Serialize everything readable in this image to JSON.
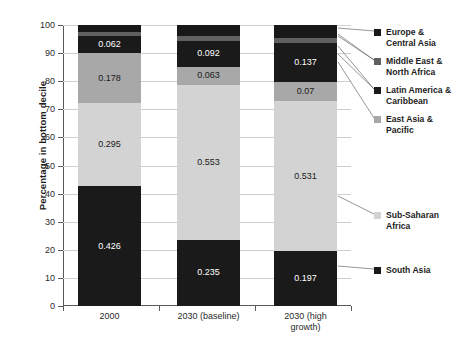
{
  "chart_data": {
    "type": "bar",
    "subtype": "stacked-bar-100-percent",
    "title": "",
    "xlabel": "",
    "ylabel": "Percentage in bottom decile",
    "ylim": [
      0,
      100
    ],
    "yticks": [
      0,
      10,
      20,
      30,
      40,
      50,
      60,
      70,
      80,
      90,
      100
    ],
    "grid": true,
    "legend_position": "right",
    "categories": [
      "2000",
      "2030 (baseline)",
      "2030 (high growth)"
    ],
    "stack_order_bottom_to_top": [
      "South Asia",
      "Sub-Saharan Africa",
      "East Asia & Pacific",
      "Latin America & Caribbean",
      "Middle East & North Africa",
      "Europe & Central Asia"
    ],
    "series": [
      {
        "name": "South Asia",
        "color": "#1a1a1a",
        "values": [
          42.6,
          23.5,
          19.7
        ],
        "labels": [
          "0.426",
          "0.235",
          "0.197"
        ],
        "label_color": "light"
      },
      {
        "name": "Sub-Saharan Africa",
        "color": "#d3d3d3",
        "values": [
          29.5,
          55.3,
          53.1
        ],
        "labels": [
          "0.295",
          "0.553",
          "0.531"
        ],
        "label_color": "dark"
      },
      {
        "name": "East Asia & Pacific",
        "color": "#a8a8a8",
        "values": [
          17.8,
          6.3,
          7.0
        ],
        "labels": [
          "0.178",
          "0.063",
          "0.07"
        ],
        "label_color": "dark"
      },
      {
        "name": "Latin America & Caribbean",
        "color": "#1a1a1a",
        "values": [
          6.2,
          9.2,
          13.7
        ],
        "labels": [
          "0.062",
          "0.092",
          "0.137"
        ],
        "label_color": "light"
      },
      {
        "name": "Middle East & North Africa",
        "color": "#606060",
        "values": [
          1.5,
          1.9,
          1.8
        ],
        "labels": [
          "",
          "",
          ""
        ],
        "label_color": "light"
      },
      {
        "name": "Europe & Central Asia",
        "color": "#181818",
        "values": [
          2.4,
          3.8,
          4.7
        ],
        "labels": [
          "",
          "",
          ""
        ],
        "label_color": "light"
      }
    ]
  },
  "axis": {
    "y_title": "Percentage in bottom decile",
    "y_labels": [
      "100",
      "90",
      "80",
      "70",
      "60",
      "50",
      "40",
      "30",
      "20",
      "10",
      "0"
    ],
    "x_labels": [
      "2000",
      "2030 (baseline)",
      "2030 (high\ngrowth)"
    ]
  },
  "bar_labels": {
    "b0s0": "0.426",
    "b0s1": "0.295",
    "b0s2": "0.178",
    "b0s3": "0.062",
    "b1s0": "0.235",
    "b1s1": "0.553",
    "b1s2": "0.063",
    "b1s3": "0.092",
    "b2s0": "0.197",
    "b2s1": "0.531",
    "b2s2": "0.07",
    "b2s3": "0.137"
  },
  "legend": {
    "items": [
      {
        "label": "Europe &\nCentral Asia",
        "color": "#181818"
      },
      {
        "label": "Middle East &\nNorth Africa",
        "color": "#606060"
      },
      {
        "label": "Latin America &\nCaribbean",
        "color": "#1a1a1a"
      },
      {
        "label": "East Asia &\nPacific",
        "color": "#a8a8a8"
      },
      {
        "label": "Sub-Saharan\nAfrica",
        "color": "#d3d3d3"
      },
      {
        "label": "South Asia",
        "color": "#1a1a1a"
      }
    ]
  }
}
